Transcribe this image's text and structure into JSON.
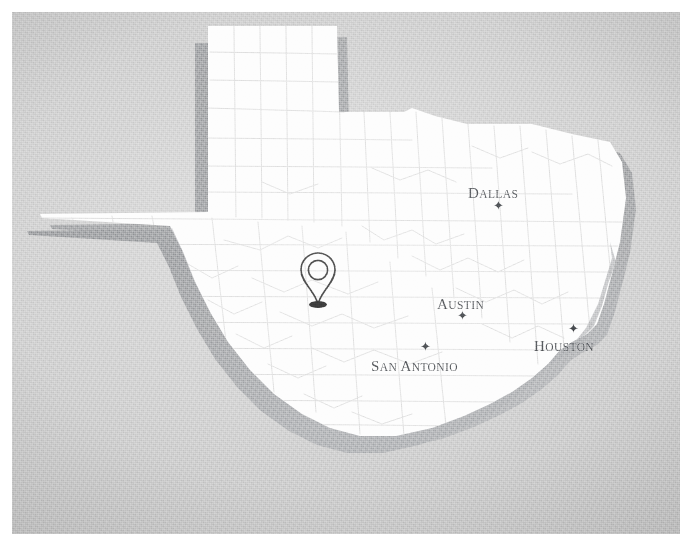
{
  "map": {
    "title": "Texas",
    "background_color": "#c8c8c8",
    "state_fill": "#fdfdfd",
    "state_shadow_color": "#8f9194",
    "county_line_color": "#dddddd",
    "label_color": "#3f4246",
    "cities": [
      {
        "name": "Dallas",
        "cap": "D",
        "rest": "ALLAS",
        "marker": "star",
        "marker_glyph": "✦",
        "marker_position": "below"
      },
      {
        "name": "Austin",
        "cap": "A",
        "rest": "USTIN",
        "marker": "star",
        "marker_glyph": "✦",
        "marker_position": "below"
      },
      {
        "name": "San Antonio",
        "cap": "S",
        "rest": "AN ",
        "cap2": "A",
        "rest2": "NTONIO",
        "marker": "star",
        "marker_glyph": "✦",
        "marker_position": "above"
      },
      {
        "name": "Houston",
        "cap": "H",
        "rest": "OUSTON",
        "marker": "star",
        "marker_glyph": "✦",
        "marker_position": "above"
      }
    ],
    "pin": {
      "icon": "map-pin-icon",
      "outline_color": "#2b2b2b",
      "base_color": "#1b1b1b"
    }
  }
}
